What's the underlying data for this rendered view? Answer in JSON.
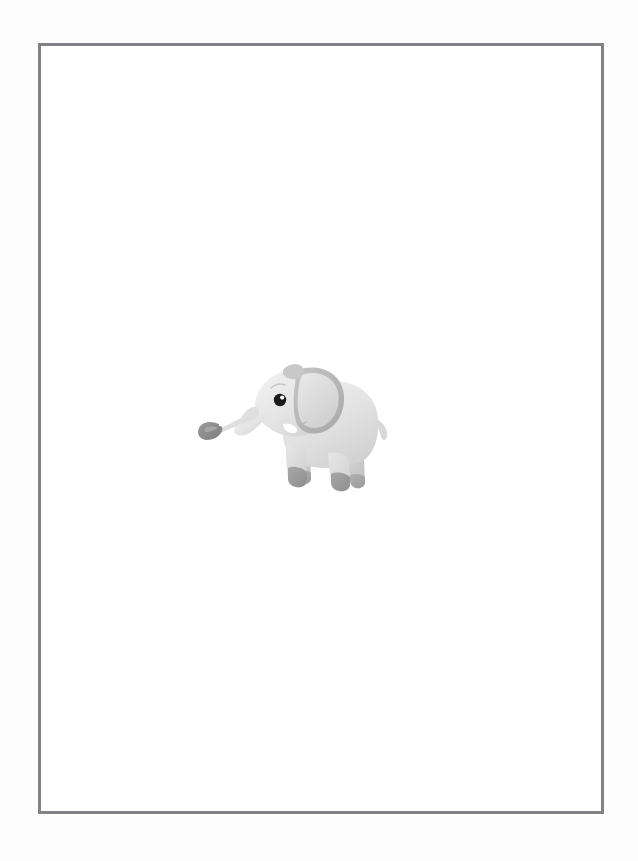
{
  "page": {
    "background_color": "#fdfdfd",
    "width": 638,
    "height": 861
  },
  "frame": {
    "name": "border-frame",
    "border_color": "#808285",
    "border_width_px": 3,
    "fill_color": "#ffffff",
    "x": 38,
    "y": 43,
    "width": 566,
    "height": 771
  },
  "illustration": {
    "title": "Baby Elephant",
    "subject": "elephant",
    "style": "flat cartoon clip-art",
    "x": 197,
    "y": 356,
    "width": 208,
    "height": 140,
    "colors": {
      "body_light": "#e8e8e8",
      "body_mid": "#dcdcdc",
      "body_shadow": "#c9c9c9",
      "ear_outer": "#bdbdbd",
      "ear_inner": "#d6d6d6",
      "foot_dark": "#9a9a9a",
      "trunk_tip": "#8e8e8e",
      "eye": "#1a1a1a",
      "eye_highlight": "#ffffff",
      "tusk": "#ffffff",
      "outline": "#b5b5b5"
    },
    "parts": [
      {
        "name": "trunk",
        "label": "Curled trunk with spiral tip"
      },
      {
        "name": "head",
        "label": "Head"
      },
      {
        "name": "ear",
        "label": "Large rounded ear"
      },
      {
        "name": "eye",
        "label": "Eye with white highlight"
      },
      {
        "name": "tusk",
        "label": "Small white tusk"
      },
      {
        "name": "mouth",
        "label": "Mouth line"
      },
      {
        "name": "body",
        "label": "Rounded body"
      },
      {
        "name": "front-leg-near",
        "label": "Near front leg"
      },
      {
        "name": "front-leg-far",
        "label": "Far front leg"
      },
      {
        "name": "hind-leg-near",
        "label": "Near hind leg"
      },
      {
        "name": "hind-leg-far",
        "label": "Far hind leg"
      },
      {
        "name": "tail",
        "label": "Short tail"
      }
    ]
  }
}
